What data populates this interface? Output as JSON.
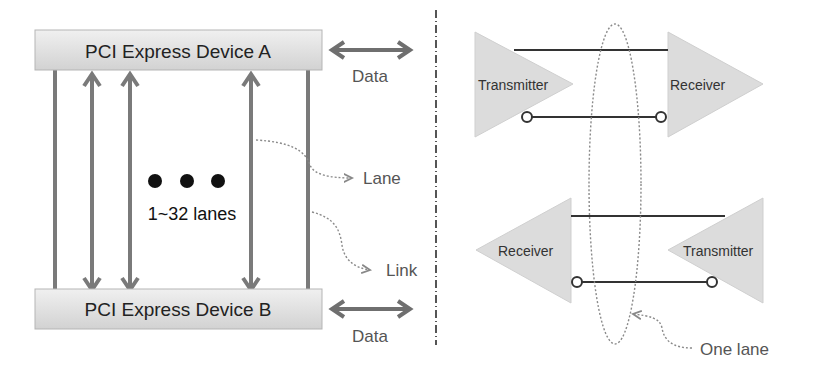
{
  "left_panel": {
    "device_a": "PCI Express Device A",
    "device_b": "PCI Express Device B",
    "data_top": "Data",
    "data_bottom": "Data",
    "lane_label": "Lane",
    "link_label": "Link",
    "lanes_count": "1~32 lanes",
    "ellipsis": "● ● ●"
  },
  "right_panel": {
    "top_transmitter": "Transmitter",
    "top_receiver": "Receiver",
    "bottom_receiver": "Receiver",
    "bottom_transmitter": "Transmitter",
    "one_lane": "One lane"
  },
  "colors": {
    "device_fill": "#e4e4e4",
    "lane_gray": "#7a7a7a",
    "triangle_fill": "#dcdcdc",
    "wire": "#333333",
    "dotted": "#888888"
  }
}
